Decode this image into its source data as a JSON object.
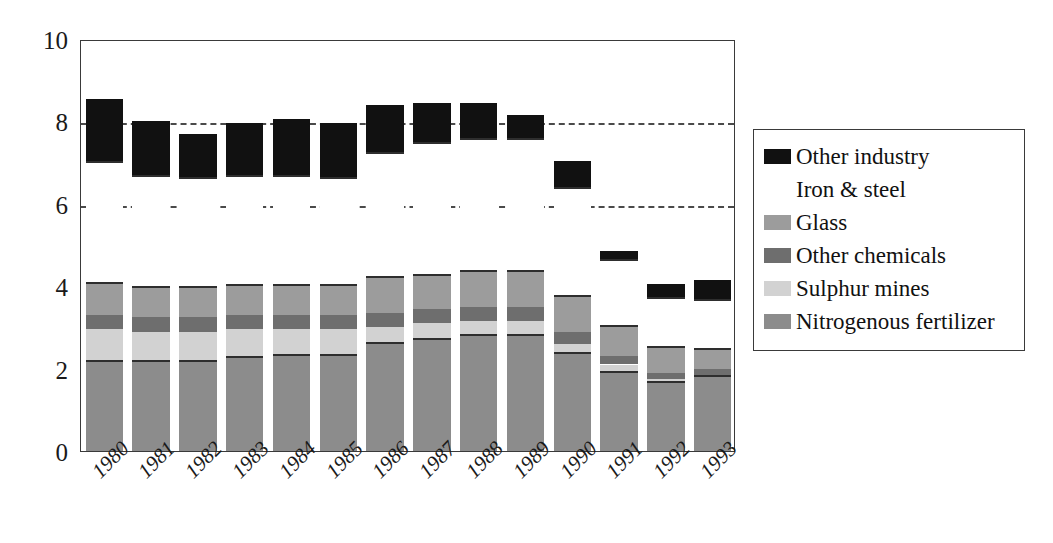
{
  "chart_data": {
    "type": "bar",
    "subtype": "stacked",
    "title": "",
    "xlabel": "",
    "ylabel": "",
    "ylim": [
      0,
      10
    ],
    "yticks": [
      0,
      2,
      4,
      6,
      8,
      10
    ],
    "ytick_labels": [
      "0",
      "2",
      "4",
      "6",
      "8",
      "10"
    ],
    "gridlines": {
      "visible_at": [
        6,
        8
      ],
      "style": "dashed"
    },
    "legend_position": "right",
    "categories": [
      "1980",
      "1981",
      "1982",
      "1983",
      "1984",
      "1985",
      "1986",
      "1987",
      "1988",
      "1989",
      "1990",
      "1991",
      "1992",
      "1993"
    ],
    "series": [
      {
        "name": "Nitrogenous fertilizer",
        "color": "#8c8c8c",
        "values": [
          2.15,
          2.15,
          2.15,
          2.25,
          2.3,
          2.3,
          2.6,
          2.7,
          2.8,
          2.8,
          2.35,
          1.9,
          1.65,
          1.8
        ]
      },
      {
        "name": "Sulphur mines",
        "color": "#d2d2d2",
        "values": [
          0.8,
          0.75,
          0.75,
          0.7,
          0.65,
          0.65,
          0.4,
          0.4,
          0.35,
          0.35,
          0.25,
          0.2,
          0.1,
          0.05
        ]
      },
      {
        "name": "Other chemicals",
        "color": "#6e6e6e",
        "values": [
          0.35,
          0.35,
          0.35,
          0.35,
          0.35,
          0.35,
          0.35,
          0.35,
          0.35,
          0.35,
          0.3,
          0.2,
          0.15,
          0.15
        ]
      },
      {
        "name": "Glass",
        "color": "#9c9c9c",
        "values": [
          0.75,
          0.7,
          0.7,
          0.7,
          0.7,
          0.7,
          0.85,
          0.8,
          0.85,
          0.85,
          0.85,
          0.7,
          0.6,
          0.45
        ]
      },
      {
        "name": "Iron & steel",
        "color": "#ffffff",
        "values": [
          2.95,
          2.7,
          2.65,
          2.65,
          2.65,
          2.6,
          3.0,
          3.2,
          3.2,
          3.2,
          2.6,
          1.6,
          1.2,
          1.2
        ]
      },
      {
        "name": "Other industry",
        "color": "#111111",
        "values": [
          1.55,
          1.35,
          1.1,
          1.3,
          1.4,
          1.35,
          1.2,
          1.0,
          0.9,
          0.6,
          0.7,
          0.25,
          0.35,
          0.5
        ]
      }
    ],
    "totals": [
      8.55,
      8.0,
      7.7,
      7.95,
      8.05,
      7.95,
      8.4,
      8.45,
      8.45,
      8.15,
      7.05,
      4.85,
      4.05,
      4.15
    ]
  },
  "y_axis": {
    "ticks": [
      {
        "label": "10",
        "value": 10
      },
      {
        "label": "8",
        "value": 8
      },
      {
        "label": "6",
        "value": 6
      },
      {
        "label": "4",
        "value": 4
      },
      {
        "label": "2",
        "value": 2
      },
      {
        "label": "0",
        "value": 0
      }
    ]
  },
  "legend": {
    "items": [
      {
        "label": "Other industry",
        "color": "#111111",
        "swatch_border": "none"
      },
      {
        "label": "Iron & steel",
        "color": "#ffffff",
        "swatch_border": "none"
      },
      {
        "label": "Glass",
        "color": "#9c9c9c",
        "swatch_border": "none"
      },
      {
        "label": "Other chemicals",
        "color": "#6e6e6e",
        "swatch_border": "none"
      },
      {
        "label": "Sulphur mines",
        "color": "#d2d2d2",
        "swatch_border": "none"
      },
      {
        "label": "Nitrogenous fertilizer",
        "color": "#8c8c8c",
        "swatch_border": "none"
      }
    ]
  }
}
